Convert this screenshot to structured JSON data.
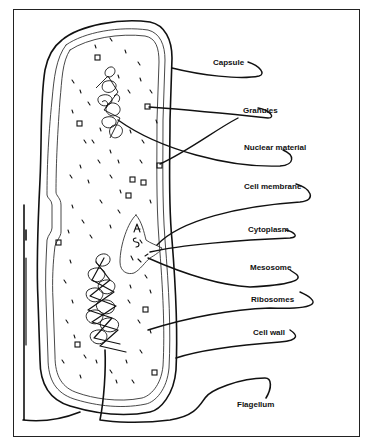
{
  "diagram": {
    "labels": [
      {
        "id": "capsule",
        "text": "Capsule",
        "x": 213,
        "y": 62
      },
      {
        "id": "granules",
        "text": "Granules",
        "x": 243,
        "y": 107
      },
      {
        "id": "nuclear-material",
        "text": "Nuclear material",
        "x": 244,
        "y": 144
      },
      {
        "id": "cell-membrane",
        "text": "Cell membrane",
        "x": 244,
        "y": 183
      },
      {
        "id": "cytoplasm",
        "text": "Cytoplasm",
        "x": 248,
        "y": 226
      },
      {
        "id": "mesosome",
        "text": "Mesosome",
        "x": 250,
        "y": 264
      },
      {
        "id": "ribosomes",
        "text": "Ribosomes",
        "x": 251,
        "y": 296
      },
      {
        "id": "cell-wall",
        "text": "Cell wall",
        "x": 253,
        "y": 329
      },
      {
        "id": "flagellum",
        "text": "Flagellum",
        "x": 237,
        "y": 400
      }
    ],
    "colors": {
      "line": "#111111",
      "background": "#ffffff",
      "frame": "#222222"
    }
  }
}
